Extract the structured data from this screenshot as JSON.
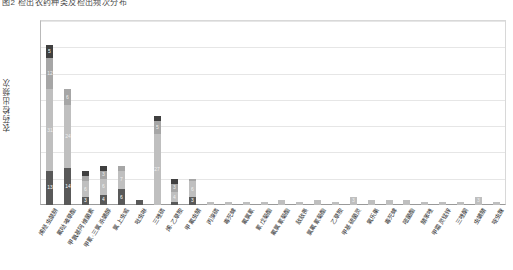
{
  "title": "图2 检出农药种类及检出频次分布",
  "axis": {
    "ylabel": "农药检出频次",
    "yticks": [
      0,
      10,
      20,
      30,
      40,
      50,
      60,
      70
    ],
    "ymin": 0,
    "ymax": 70
  },
  "colors": {
    "s1": "#7f7f7f",
    "s2": "#a6a6a6",
    "s3": "#bfbfbf",
    "s4": "#595959",
    "s5": "#404040",
    "grid": "#e6e6e6",
    "axis": "#9a9a9a",
    "text": "#2e2e2e"
  },
  "chart_data": {
    "type": "bar",
    "stacked": true,
    "title": "图2 检出农药种类及检出频次分布",
    "xlabel": "",
    "ylabel": "农药检出频次",
    "ylim": [
      0,
      70
    ],
    "grid": true,
    "legend": "none",
    "categories": [
      "烯烃虫酰肼",
      "氟哒嗪草酯",
      "甲氨基阿维菌素",
      "甲氰·三氯杀螨醇",
      "氯上虫威",
      "吡虫啉",
      "三唑磷",
      "烯·乙草胺",
      "甲氟虫腈",
      "丙溴磷",
      "毒死蜱",
      "氟氯氰",
      "氰戊菊酯",
      "氟氯氰菊酯",
      "敌敌畏",
      "氯氟氰菊酯",
      "乙草胺",
      "甲基硫菌灵",
      "氧乐果",
      "毒死蜱",
      "嘧菌酯",
      "腈苯唑",
      "甲霜灵锰锌",
      "三唑酮",
      "虫螨腈",
      "啶虫脒"
    ],
    "series": [
      {
        "name": "第1层",
        "values": [
          13,
          14,
          3,
          4,
          6,
          2,
          0,
          1,
          3,
          0,
          0,
          0,
          0,
          0,
          0,
          0,
          0,
          0,
          0,
          0,
          0,
          0,
          0,
          0,
          0,
          0
        ]
      },
      {
        "name": "第2层",
        "values": [
          31,
          24,
          6,
          6,
          7,
          0,
          27,
          4,
          6,
          1,
          1,
          1,
          1,
          2,
          1,
          2,
          1,
          3,
          2,
          2,
          2,
          1,
          1,
          1,
          3,
          1
        ]
      },
      {
        "name": "第3层",
        "values": [
          12,
          6,
          2,
          3,
          2,
          0,
          5,
          3,
          1,
          0,
          0,
          0,
          0,
          0,
          0,
          0,
          0,
          0,
          0,
          0,
          0,
          0,
          0,
          0,
          0,
          0
        ]
      },
      {
        "name": "第4层",
        "values": [
          5,
          0,
          2,
          2,
          0,
          0,
          2,
          2,
          0,
          0,
          0,
          0,
          0,
          0,
          0,
          0,
          0,
          0,
          0,
          0,
          0,
          0,
          0,
          0,
          0,
          0
        ]
      }
    ],
    "totals": [
      61,
      44,
      13,
      15,
      15,
      2,
      34,
      10,
      10,
      1,
      1,
      1,
      1,
      2,
      1,
      2,
      1,
      3,
      2,
      2,
      2,
      1,
      1,
      1,
      3,
      1
    ],
    "bar_labels": [
      [
        "13",
        "31",
        "12",
        "5"
      ],
      [
        "14",
        "24",
        "6",
        ""
      ],
      [
        "3",
        "6",
        "2",
        "2"
      ],
      [
        "4",
        "6",
        "3",
        "2"
      ],
      [
        "6",
        "7",
        "2",
        ""
      ],
      [
        "",
        "",
        "",
        ""
      ],
      [
        "",
        "27",
        "5",
        "2"
      ],
      [
        "",
        "4",
        "3",
        "2"
      ],
      [
        "3",
        "6",
        "1",
        ""
      ],
      [
        "",
        "",
        "",
        ""
      ],
      [
        "",
        "",
        "",
        ""
      ],
      [
        "",
        "",
        "",
        ""
      ],
      [
        "",
        "",
        "",
        ""
      ],
      [
        "",
        "",
        "",
        ""
      ],
      [
        "",
        "",
        "",
        ""
      ],
      [
        "",
        "",
        "",
        ""
      ],
      [
        "",
        "",
        "",
        ""
      ],
      [
        "",
        "3",
        "",
        ""
      ],
      [
        "",
        "",
        "",
        ""
      ],
      [
        "",
        "",
        "",
        ""
      ],
      [
        "",
        "",
        "",
        ""
      ],
      [
        "",
        "",
        "",
        ""
      ],
      [
        "",
        "",
        "",
        ""
      ],
      [
        "",
        "",
        "",
        ""
      ],
      [
        "",
        "3",
        "",
        ""
      ],
      [
        "",
        "",
        "",
        ""
      ]
    ]
  }
}
